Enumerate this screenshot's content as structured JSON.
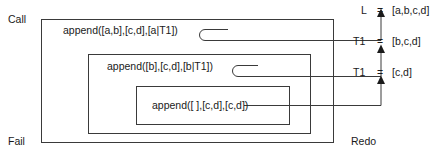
{
  "diagram": {
    "stroke_color": "#3a3a3a",
    "text_color": "#1a1a1a",
    "background": "#ffffff",
    "ports": {
      "call_label": "Call",
      "fail_label": "Fail",
      "redo_label": "Redo"
    },
    "frames": [
      {
        "name": "outer-frame",
        "goal": "append([a,b],[c,d],[a|T1])",
        "result_var": "L",
        "result_eq": "=",
        "result_value": "[a,b,c,d]"
      },
      {
        "name": "middle-frame",
        "goal": "append([b],[c,d],[b|T1])",
        "result_var": "T1",
        "result_eq": "=",
        "result_value": "[b,c,d]"
      },
      {
        "name": "inner-frame",
        "goal": "append([ ],[c,d],[c,d])",
        "result_var": "T1",
        "result_eq": "=",
        "result_value": "[c,d]"
      }
    ]
  }
}
